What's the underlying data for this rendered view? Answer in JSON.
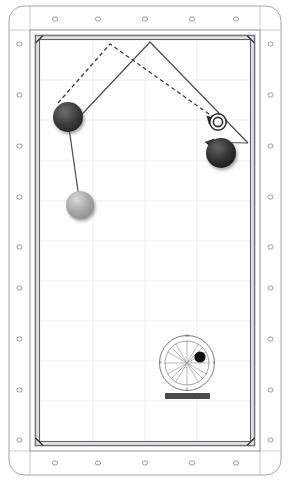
{
  "diagram": {
    "type": "billiards-shot-diagram",
    "orientation": "portrait",
    "table": {
      "outer_frame": {
        "x": 9,
        "y": 6,
        "width": 272,
        "height": 469,
        "corner_radius": 14,
        "stroke": "#8d8d8d",
        "fill": "#ffffff"
      },
      "rail_band": {
        "x": 30,
        "y": 30,
        "width": 230,
        "height": 421,
        "stroke": "#6f6f6f"
      },
      "playfield": {
        "x": 38,
        "y": 38,
        "width": 214,
        "height": 405,
        "fill": "#fdfdfd",
        "stroke": "#3a3a3a"
      },
      "cushion_color": "#b9b9b9",
      "cushion_edge_color": "#4a4a4a",
      "grid_color": "#ededf2",
      "diamond_color": "#6d6d78",
      "diamonds_long_rail_count": 9,
      "diamonds_short_rail_count": 5
    },
    "balls": [
      {
        "id": "object-ball-left",
        "label": "object ball",
        "cx": 68,
        "cy": 117,
        "r": 15,
        "color": "#3a3a3a",
        "highlight": "#6e6e6e"
      },
      {
        "id": "object-ball-right",
        "label": "object ball",
        "cx": 221,
        "cy": 153,
        "r": 15,
        "color": "#2f2f2f",
        "highlight": "#646464"
      },
      {
        "id": "cue-ball",
        "label": "cue ball",
        "cx": 80,
        "cy": 205,
        "r": 14,
        "color": "#9d9d9d",
        "highlight": "#d8d8d8"
      }
    ],
    "ghost_ball": {
      "id": "ghost-ball-target",
      "label": "ghost ball target",
      "cx": 218,
      "cy": 122,
      "r_outer": 8.5,
      "r_inner": 5.5,
      "stroke": "#2a2a2a"
    },
    "paths": {
      "solid": {
        "style": "solid",
        "color": "#4e4e58",
        "points": "80,205 70,130 150,42 248,143",
        "description": "cue ball travel through object ball banking off top rail"
      },
      "dashed": {
        "style": "dashed",
        "color": "#3d3d45",
        "dash": "4 3",
        "points": "58,103 110,44 216,119",
        "description": "aim line banking off top rail into ghost ball"
      },
      "arrows": [
        {
          "id": "arrow-to-ghost-ball",
          "x": 216,
          "y": 119,
          "angle": 35,
          "color": "#2a2a2a"
        },
        {
          "id": "arrow-to-object-ball",
          "x": 207,
          "y": 141,
          "angle": 130,
          "color": "#2a2a2a"
        }
      ]
    },
    "clock_face": {
      "id": "english-clock-face",
      "label": "cue tip contact point clock face",
      "cx": 187,
      "cy": 363,
      "r_outer": 28,
      "r_inner": 22,
      "spoke_color": "#8c8c96",
      "ring_color": "#55555f",
      "numbers": [
        {
          "text": "12",
          "position": "top"
        },
        {
          "text": "3",
          "position": "right"
        },
        {
          "text": "6",
          "position": "bottom"
        },
        {
          "text": "9",
          "position": "left"
        }
      ],
      "contact_dot": {
        "label": "tip contact point",
        "cx": 200,
        "cy": 357,
        "r": 5.5,
        "color": "#111111"
      },
      "cue_bar": {
        "label": "cue stick level bar",
        "x": 165,
        "y": 393,
        "width": 45,
        "height": 6,
        "color": "#4a4a4a"
      }
    }
  }
}
